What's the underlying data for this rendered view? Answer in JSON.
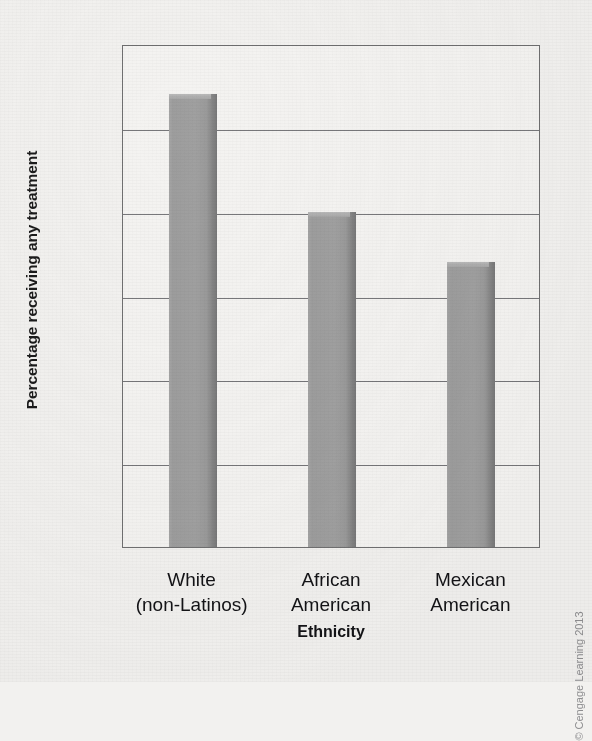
{
  "chart_data": {
    "type": "bar",
    "title": "",
    "subtitle": "",
    "xlabel": "Ethnicity",
    "ylabel": "Percentage receiving any treatment",
    "categories": [
      "White\n(non-Latinos)",
      "African\nAmerican",
      "Mexican\nAmerican"
    ],
    "category_lines": [
      [
        "White",
        "(non-Latinos)"
      ],
      [
        "African",
        "American"
      ],
      [
        "Mexican",
        "American"
      ]
    ],
    "values": [
      54,
      40,
      34
    ],
    "ylim": [
      0,
      60
    ],
    "yticks": [
      0,
      10,
      20,
      30,
      40,
      50,
      60
    ],
    "ytick_labels": [
      "0",
      "10",
      "20",
      "30",
      "40",
      "50",
      "60"
    ],
    "grid": true,
    "grid_axis": "y",
    "legend": "none",
    "bar_color": "#9d9d9d",
    "bar_edge_color": "#7c7c7c",
    "axis_color": "#6f6f70",
    "background_color": "#f2f1ef"
  },
  "credit": {
    "text": "© Cengage Learning 2013"
  }
}
